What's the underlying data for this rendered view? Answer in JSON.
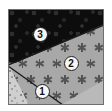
{
  "figure": {
    "background_color": "#ffffff",
    "panel": {
      "left": 8,
      "top": 9,
      "width": 96,
      "height": 96,
      "border_color": "#6f6f6f"
    }
  },
  "units": [
    {
      "id": "unit-1",
      "label": "1",
      "position_name": "lower-left",
      "fill_color": "#cfcfcf",
      "pattern_name": "fine-stipple",
      "label_x": 34,
      "label_y": 82
    },
    {
      "id": "unit-2",
      "label": "2",
      "position_name": "middle-band",
      "fill_color": "#a8a8a8",
      "pattern_name": "six-point-star-grid",
      "label_x": 63,
      "label_y": 54
    },
    {
      "id": "unit-3",
      "label": "3",
      "position_name": "upper-left",
      "fill_color": "#0d0d0d",
      "pattern_name": "dark-blob-stipple",
      "label_x": 32,
      "label_y": 25
    }
  ],
  "contacts": [
    {
      "id": "contact-3-2",
      "name": "upper-contact",
      "x1": 0,
      "y1": 56,
      "x2": 96,
      "y2": 16
    },
    {
      "id": "contact-2-1",
      "name": "lower-contact",
      "x1": 0,
      "y1": 57,
      "x2": 55,
      "y2": 96
    }
  ],
  "star_grid": {
    "color": "#545454",
    "spacing_x": 17,
    "spacing_y": 16,
    "offset_x": 6,
    "offset_y": 6,
    "columns": 7,
    "rows": 7
  }
}
